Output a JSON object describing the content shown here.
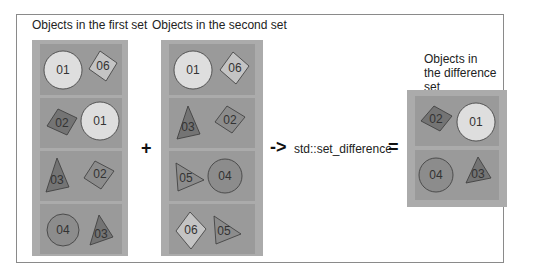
{
  "labels": {
    "first_set": "Objects in the first set",
    "second_set": "Objects in the second set",
    "difference_set_line1": "Objects in",
    "difference_set_line2": "the difference",
    "difference_set_line3": "set"
  },
  "operators": {
    "plus": "+",
    "arrow": "->",
    "function": "std::set_difference",
    "equals": "="
  },
  "colors": {
    "frame_border": "#8a8a8a",
    "set_box": "#ababab",
    "cell": "#9a9a9a",
    "light_shape": "#dedede",
    "mid_shape": "#8c8c8c",
    "dark_shape": "#747474",
    "stroke": "#3a3a3a"
  },
  "first_set": [
    {
      "left": {
        "shape": "circle",
        "label": "01",
        "fill": "light"
      },
      "right": {
        "shape": "diamond",
        "label": "06",
        "fill": "light-mid"
      }
    },
    {
      "left": {
        "shape": "diamond",
        "label": "02",
        "fill": "dark"
      },
      "right": {
        "shape": "circle",
        "label": "01",
        "fill": "light"
      }
    },
    {
      "left": {
        "shape": "triangle",
        "label": "03",
        "fill": "dark"
      },
      "right": {
        "shape": "diamond",
        "label": "02",
        "fill": "mid"
      }
    },
    {
      "left": {
        "shape": "circle",
        "label": "04",
        "fill": "mid"
      },
      "right": {
        "shape": "triangle",
        "label": "03",
        "fill": "dark"
      }
    }
  ],
  "second_set": [
    {
      "left": {
        "shape": "circle",
        "label": "01",
        "fill": "light"
      },
      "right": {
        "shape": "diamond",
        "label": "06",
        "fill": "light-mid"
      }
    },
    {
      "left": {
        "shape": "triangle",
        "label": "03",
        "fill": "dark"
      },
      "right": {
        "shape": "diamond",
        "label": "02",
        "fill": "mid"
      }
    },
    {
      "left": {
        "shape": "triangle-right",
        "label": "05",
        "fill": "mid"
      },
      "right": {
        "shape": "circle",
        "label": "04",
        "fill": "mid"
      }
    },
    {
      "left": {
        "shape": "diamond",
        "label": "06",
        "fill": "light-mid"
      },
      "right": {
        "shape": "triangle-right",
        "label": "05",
        "fill": "mid"
      }
    }
  ],
  "difference_set": [
    {
      "left": {
        "shape": "diamond",
        "label": "02",
        "fill": "dark"
      },
      "right": {
        "shape": "circle",
        "label": "01",
        "fill": "light"
      }
    },
    {
      "left": {
        "shape": "circle",
        "label": "04",
        "fill": "mid"
      },
      "right": {
        "shape": "triangle",
        "label": "03",
        "fill": "dark"
      }
    }
  ]
}
